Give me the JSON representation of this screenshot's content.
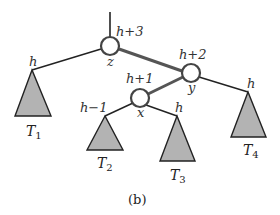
{
  "diagram": {
    "caption": "(b)",
    "nodes": [
      {
        "id": "z",
        "label": "z",
        "height": "h+3"
      },
      {
        "id": "y",
        "label": "y",
        "height": "h+2"
      },
      {
        "id": "x",
        "label": "x",
        "height": "h+1"
      }
    ],
    "subtrees": [
      {
        "id": "T1",
        "name": "T",
        "sub": "1",
        "height": "h"
      },
      {
        "id": "T2",
        "name": "T",
        "sub": "2",
        "height": "h−1"
      },
      {
        "id": "T3",
        "name": "T",
        "sub": "3",
        "height": "h"
      },
      {
        "id": "T4",
        "name": "T",
        "sub": "4",
        "height": "h"
      }
    ],
    "colors": {
      "edge": "#222222",
      "highlight_edge": "#555555",
      "node_stroke": "#444444",
      "subtree_fill": "#b3b3b3"
    }
  }
}
